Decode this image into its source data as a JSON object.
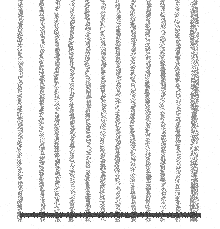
{
  "figure": {
    "name": "dithered-vertical-gridline-plot",
    "width": 220,
    "height": 229,
    "background_color": "#ffffff",
    "render_style": "dithered-halftone",
    "title": "",
    "subtitle": ""
  },
  "colors": {
    "background": "#ffffff",
    "gridline": "#b0b0b0",
    "gridline_dark": "#8c8c8c",
    "axis": "#555555",
    "axis_dark": "#3c3c3c"
  },
  "chart_data": {
    "type": "bar",
    "title": "",
    "subtitle": "",
    "xlabel": "",
    "ylabel": "",
    "categories": [
      "1",
      "2",
      "3",
      "4",
      "5",
      "6",
      "7",
      "8",
      "9",
      "10",
      "11",
      "12",
      "13"
    ],
    "values": [
      229,
      229,
      229,
      229,
      229,
      229,
      229,
      229,
      229,
      229,
      229,
      229,
      229
    ],
    "x": [
      20,
      42,
      57,
      72,
      88,
      103,
      118,
      133,
      148,
      163,
      178,
      193,
      196
    ],
    "xlim": [
      0,
      220
    ],
    "ylim": [
      0,
      229
    ],
    "grid": true,
    "legend": "none",
    "legend_entries": [],
    "annotations": []
  },
  "gridlines": {
    "orientation": "vertical",
    "count": 13,
    "bar_width_px": 4,
    "top_px": 0,
    "bottom_px": 222,
    "x_positions": [
      20,
      42,
      57,
      72,
      88,
      103,
      118,
      133,
      148,
      163,
      178,
      193,
      196
    ],
    "color": "#b0b0b0"
  },
  "axis_line": {
    "orientation": "horizontal",
    "y_px": 213,
    "thickness_px": 4,
    "x_start_px": 20,
    "x_end_px": 201,
    "color": "#555555"
  },
  "ticks": {
    "x_tick_labels": [],
    "y_tick_labels": []
  }
}
